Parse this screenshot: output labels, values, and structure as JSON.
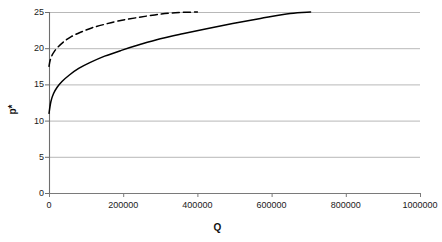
{
  "chart_data": {
    "type": "line",
    "title": "",
    "xlabel": "Q",
    "ylabel": "p*",
    "xlim": [
      0,
      1000000
    ],
    "ylim": [
      0,
      25
    ],
    "grid": true,
    "grid_axis": "y",
    "legend": false,
    "xticks": [
      "0",
      "200000",
      "400000",
      "600000",
      "800000",
      "1000000"
    ],
    "xtick_values": [
      0,
      200000,
      400000,
      600000,
      800000,
      1000000
    ],
    "yticks": [
      "0",
      "5",
      "10",
      "15",
      "20",
      "25"
    ],
    "ytick_values": [
      0,
      5,
      10,
      15,
      20,
      25
    ],
    "series": [
      {
        "name": "solid-curve",
        "style": "solid",
        "color": "#000000",
        "x": [
          0,
          5000,
          12000,
          22000,
          35000,
          55000,
          80000,
          110000,
          150000,
          195000,
          245000,
          300000,
          360000,
          425000,
          495000,
          570000,
          650000,
          705000
        ],
        "values": [
          11.0,
          12.6,
          13.7,
          14.6,
          15.4,
          16.3,
          17.2,
          18.0,
          18.9,
          19.7,
          20.5,
          21.3,
          22.0,
          22.7,
          23.4,
          24.1,
          24.8,
          25.0
        ]
      },
      {
        "name": "dashed-curve",
        "style": "dashed",
        "color": "#000000",
        "x": [
          0,
          3000,
          8000,
          15000,
          25000,
          40000,
          60000,
          85000,
          115000,
          150000,
          190000,
          235000,
          285000,
          340000,
          400000
        ],
        "values": [
          17.5,
          18.3,
          19.0,
          19.6,
          20.2,
          20.9,
          21.6,
          22.2,
          22.8,
          23.3,
          23.8,
          24.2,
          24.6,
          24.9,
          25.0
        ]
      }
    ],
    "colors": {
      "axis": "#808080",
      "gridline": "#a6a6a6",
      "curve": "#000000",
      "background": "#ffffff",
      "text": "#1a1a1a"
    }
  }
}
